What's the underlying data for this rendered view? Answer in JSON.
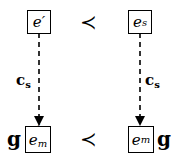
{
  "diagram": {
    "top_left": {
      "base": "e",
      "sub": "",
      "prime": "′"
    },
    "top_right": {
      "base": "e",
      "sub": "s",
      "prime": ""
    },
    "bottom_left": {
      "base": "e",
      "sub": "m",
      "prime": "′"
    },
    "bottom_right": {
      "base": "e",
      "sub": "m",
      "prime": ""
    },
    "relation_top": "≺",
    "relation_bottom": "≺",
    "edge_left_label": {
      "base": "c",
      "sub": "s"
    },
    "edge_right_label": {
      "base": "c",
      "sub": "s"
    },
    "g_left": "g",
    "g_right": "g"
  }
}
